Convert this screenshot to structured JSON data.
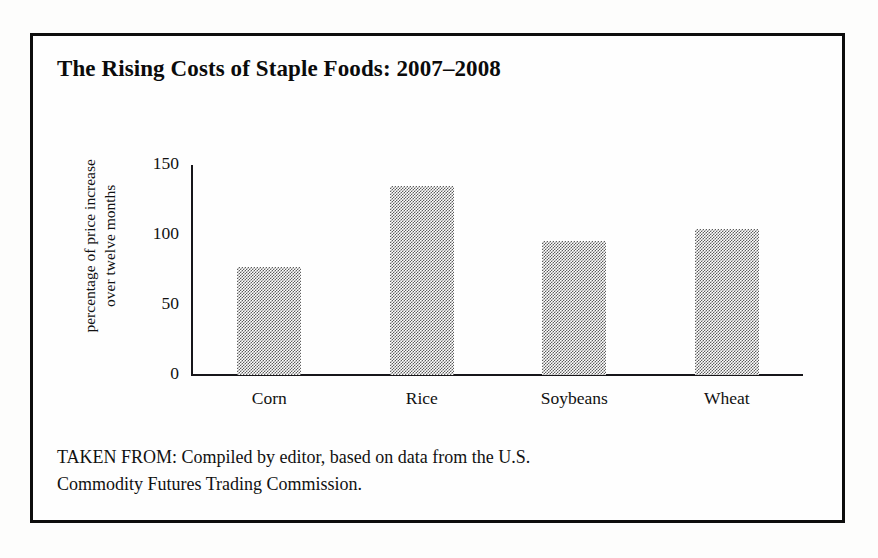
{
  "figure": {
    "title": "The Rising Costs of Staple Foods: 2007–2008",
    "source_note_line1": "TAKEN FROM: Compiled by editor, based on data from the U.S.",
    "source_note_line2": "Commodity Futures Trading Commission.",
    "frame_color": "#0d0d0d",
    "bar_fill_color": "#808080",
    "axis_color": "#17161a"
  },
  "chart_data": {
    "type": "bar",
    "title": "The Rising Costs of Staple Foods: 2007–2008",
    "categories": [
      "Corn",
      "Rice",
      "Soybeans",
      "Wheat"
    ],
    "values": [
      77,
      135,
      96,
      104
    ],
    "xlabel": "",
    "ylabel": "percentage of price increase over twelve months",
    "ylabel_line1": "percentage of price increase",
    "ylabel_line2": "over twelve months",
    "ylim": [
      0,
      150
    ],
    "yticks": [
      0,
      50,
      100,
      150
    ],
    "ytick_labels": [
      "0",
      "50",
      "100",
      "150"
    ],
    "grid": false,
    "legend": false,
    "bar_fill": "halftone-gray",
    "source": "Compiled by editor, based on data from the U.S. Commodity Futures Trading Commission."
  }
}
